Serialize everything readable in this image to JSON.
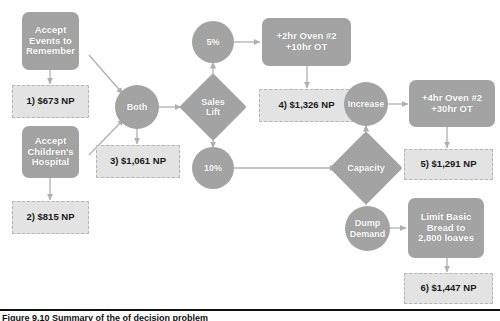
{
  "diagram": {
    "type": "decision-tree-flowchart",
    "accent_solid": "#a3a3a3",
    "accent_result": "#e3e3e3",
    "nodes": [
      {
        "id": "accept_events",
        "label": "Accept\nEvents to\nRemember",
        "shape": "rounded-box"
      },
      {
        "id": "accept_children",
        "label": "Accept\nChildren's\nHospital",
        "shape": "rounded-box"
      },
      {
        "id": "both",
        "label": "Both",
        "shape": "circle"
      },
      {
        "id": "sales_lift",
        "label": "Sales\nLift",
        "shape": "diamond"
      },
      {
        "id": "pct5",
        "label": "5%",
        "shape": "circle"
      },
      {
        "id": "pct10",
        "label": "10%",
        "shape": "circle"
      },
      {
        "id": "oven_2hr",
        "label": "+2hr Oven #2\n+10hr OT",
        "shape": "rounded-box"
      },
      {
        "id": "capacity",
        "label": "Capacity",
        "shape": "diamond"
      },
      {
        "id": "increase",
        "label": "Increase",
        "shape": "circle"
      },
      {
        "id": "dump_demand",
        "label": "Dump\nDemand",
        "shape": "circle"
      },
      {
        "id": "oven_4hr",
        "label": "+4hr Oven #2\n+30hr OT",
        "shape": "rounded-box"
      },
      {
        "id": "limit_bread",
        "label": "Limit Basic\nBread to\n2,800 loaves",
        "shape": "rounded-box"
      }
    ],
    "results": [
      {
        "id": "r1",
        "number": "1)",
        "value": "$673 NP",
        "label": "1) $673 NP"
      },
      {
        "id": "r2",
        "number": "2)",
        "value": "$815 NP",
        "label": "2) $815 NP"
      },
      {
        "id": "r3",
        "number": "3)",
        "value": "$1,061 NP",
        "label": "3) $1,061 NP"
      },
      {
        "id": "r4",
        "number": "4)",
        "value": "$1,326 NP",
        "label": "4) $1,326 NP"
      },
      {
        "id": "r5",
        "number": "5)",
        "value": "$1,291 NP",
        "label": "5) $1,291 NP"
      },
      {
        "id": "r6",
        "number": "6)",
        "value": "$1,447 NP",
        "label": "6) $1,447 NP"
      }
    ],
    "node_labels": {
      "accept_events_l1": "Accept",
      "accept_events_l2": "Events to",
      "accept_events_l3": "Remember",
      "accept_children_l1": "Accept",
      "accept_children_l2": "Children's",
      "accept_children_l3": "Hospital",
      "both": "Both",
      "sales_lift_l1": "Sales",
      "sales_lift_l2": "Lift",
      "pct5": "5%",
      "pct10": "10%",
      "oven_2hr_l1": "+2hr Oven #2",
      "oven_2hr_l2": "+10hr OT",
      "capacity": "Capacity",
      "increase": "Increase",
      "dump_demand_l1": "Dump",
      "dump_demand_l2": "Demand",
      "oven_4hr_l1": "+4hr Oven #2",
      "oven_4hr_l2": "+30hr OT",
      "limit_bread_l1": "Limit Basic",
      "limit_bread_l2": "Bread to",
      "limit_bread_l3": "2,800 loaves"
    },
    "edges": [
      {
        "from": "accept_events",
        "to": "r1"
      },
      {
        "from": "accept_events",
        "to": "both"
      },
      {
        "from": "accept_children",
        "to": "r2"
      },
      {
        "from": "accept_children",
        "to": "both"
      },
      {
        "from": "both",
        "to": "r3"
      },
      {
        "from": "both",
        "to": "sales_lift"
      },
      {
        "from": "sales_lift",
        "to": "pct5"
      },
      {
        "from": "sales_lift",
        "to": "pct10"
      },
      {
        "from": "pct5",
        "to": "oven_2hr"
      },
      {
        "from": "oven_2hr",
        "to": "r4"
      },
      {
        "from": "pct10",
        "to": "capacity"
      },
      {
        "from": "capacity",
        "to": "increase"
      },
      {
        "from": "capacity",
        "to": "dump_demand"
      },
      {
        "from": "increase",
        "to": "oven_4hr"
      },
      {
        "from": "oven_4hr",
        "to": "r5"
      },
      {
        "from": "dump_demand",
        "to": "limit_bread"
      },
      {
        "from": "limit_bread",
        "to": "r6"
      }
    ]
  },
  "caption": {
    "text": "Figure 9.10   Summary of the of decision problem"
  }
}
